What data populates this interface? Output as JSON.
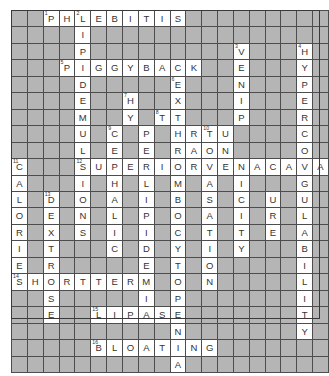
{
  "puzzle": {
    "type": "crossword-grid",
    "rows": 20,
    "cols": 20,
    "cell_fill_color": "#b5b5b5",
    "cell_open_color": "#ffffff",
    "grid_line_color": "#4d4d4d",
    "letter_color": "#333333",
    "grid": [
      [
        "",
        "",
        "P",
        "H",
        "L",
        "E",
        "B",
        "I",
        "T",
        "I",
        "S",
        "",
        "",
        "",
        "",
        "",
        "",
        "",
        "",
        ""
      ],
      [
        "",
        "",
        "",
        "",
        "I",
        "",
        "",
        "",
        "",
        "",
        "",
        "",
        "",
        "",
        "",
        "",
        "",
        "",
        "",
        ""
      ],
      [
        "",
        "",
        "",
        "",
        "P",
        "",
        "",
        "",
        "",
        "",
        "",
        "",
        "",
        "",
        "V",
        "",
        "",
        "",
        "H",
        ""
      ],
      [
        "",
        "",
        "",
        "P",
        "I",
        "G",
        "G",
        "Y",
        "B",
        "A",
        "C",
        "K",
        "",
        "",
        "E",
        "",
        "",
        "",
        "Y",
        ""
      ],
      [
        "",
        "",
        "",
        "",
        "D",
        "",
        "",
        "",
        "",
        "",
        "E",
        "",
        "",
        "",
        "N",
        "",
        "",
        "",
        "P",
        ""
      ],
      [
        "",
        "",
        "",
        "",
        "E",
        "",
        "",
        "H",
        "",
        "",
        "X",
        "",
        "",
        "",
        "I",
        "",
        "",
        "",
        "E",
        ""
      ],
      [
        "",
        "",
        "",
        "",
        "M",
        "",
        "",
        "Y",
        "",
        "T",
        "T",
        "",
        "",
        "",
        "P",
        "",
        "",
        "",
        "R",
        ""
      ],
      [
        "",
        "",
        "",
        "",
        "U",
        "",
        "C",
        "",
        "P",
        "",
        "H",
        "R",
        "T",
        "U",
        "",
        "",
        "",
        "",
        "C",
        ""
      ],
      [
        "",
        "",
        "",
        "",
        "L",
        "",
        "E",
        "",
        "E",
        "",
        "R",
        "A",
        "O",
        "N",
        "",
        "",
        "",
        "",
        "O",
        ""
      ],
      [
        "C",
        "",
        "",
        "",
        "S",
        "U",
        "P",
        "E",
        "R",
        "I",
        "O",
        "R",
        "V",
        "E",
        "N",
        "A",
        "C",
        "A",
        "V",
        "A"
      ],
      [
        "A",
        "",
        "",
        "",
        "I",
        "",
        "H",
        "",
        "L",
        "",
        "M",
        "",
        "A",
        "",
        "I",
        "",
        "",
        "",
        "G",
        ""
      ],
      [
        "L",
        "",
        "D",
        "",
        "O",
        "",
        "A",
        "",
        "I",
        "",
        "B",
        "",
        "S",
        "",
        "C",
        "",
        "U",
        "",
        "U",
        ""
      ],
      [
        "O",
        "",
        "E",
        "",
        "N",
        "",
        "L",
        "",
        "P",
        "",
        "O",
        "",
        "A",
        "",
        "I",
        "",
        "R",
        "",
        "L",
        ""
      ],
      [
        "R",
        "",
        "X",
        "",
        "S",
        "",
        "I",
        "",
        "I",
        "",
        "C",
        "",
        "T",
        "",
        "T",
        "",
        "E",
        "",
        "A",
        ""
      ],
      [
        "I",
        "",
        "T",
        "",
        "",
        "",
        "C",
        "",
        "D",
        "",
        "Y",
        "",
        "I",
        "",
        "Y",
        "",
        "",
        "",
        "B",
        ""
      ],
      [
        "E",
        "",
        "R",
        "",
        "",
        "",
        "",
        "",
        "E",
        "",
        "T",
        "",
        "O",
        "",
        "",
        "",
        "",
        "",
        "I",
        ""
      ],
      [
        "S",
        "H",
        "O",
        "R",
        "T",
        "T",
        "E",
        "R",
        "M",
        "",
        "O",
        "",
        "N",
        "",
        "",
        "",
        "",
        "",
        "L",
        ""
      ],
      [
        "",
        "",
        "S",
        "",
        "",
        "",
        "",
        "",
        "I",
        "",
        "P",
        "",
        "",
        "",
        "",
        "",
        "",
        "",
        "I",
        ""
      ],
      [
        "",
        "",
        "E",
        "",
        "",
        "L",
        "I",
        "P",
        "A",
        "S",
        "E",
        "",
        "",
        "",
        "",
        "",
        "",
        "",
        "T",
        ""
      ],
      [
        "",
        "",
        "",
        "",
        "",
        "",
        "",
        "",
        "",
        "",
        "N",
        "",
        "",
        "",
        "",
        "",
        "",
        "",
        "Y",
        ""
      ]
    ],
    "extra_rows": [
      [
        "",
        "",
        "",
        "",
        "",
        "B",
        "L",
        "O",
        "A",
        "T",
        "I",
        "N",
        "G",
        "",
        "",
        "",
        "",
        "",
        "",
        ""
      ],
      [
        "",
        "",
        "",
        "",
        "",
        "",
        "",
        "",
        "",
        "",
        "A",
        "",
        "",
        "",
        "",
        "",
        "",
        "",
        "",
        ""
      ]
    ],
    "numbers": {
      "0_2": "1",
      "0_4": "2",
      "2_14": "3",
      "2_18": "4",
      "3_3": "5",
      "4_10": "6",
      "5_7": "7",
      "6_9": "8",
      "7_6": "9",
      "7_12": "10",
      "9_0": "11",
      "9_4": "12",
      "11_2": "13",
      "16_0": "14",
      "18_5": "15",
      "20_5": "16"
    },
    "answers_across": [
      {
        "number": "1",
        "text": "PHLEBITIS"
      },
      {
        "number": "5",
        "text": "PIGGYBACK"
      },
      {
        "number": "12",
        "text": "SUPERIORVENACAVA"
      },
      {
        "number": "14",
        "text": "SHORTTERM"
      },
      {
        "number": "15",
        "text": "LIPASE"
      },
      {
        "number": "16",
        "text": "BLOATING"
      }
    ],
    "answers_down": [
      {
        "number": "2",
        "text": "LIPIDEMULSION"
      },
      {
        "number": "3",
        "text": "VENIPUNCTURE"
      },
      {
        "number": "4",
        "text": "HYPERCOAGULABILITY"
      },
      {
        "number": "6",
        "text": "EXTRAVASATION"
      },
      {
        "number": "7",
        "text": "HYPERLIPIDEMIA"
      },
      {
        "number": "8",
        "text": "THROMBOCYTOPENIA"
      },
      {
        "number": "9",
        "text": "CEPHALIC"
      },
      {
        "number": "10",
        "text": "TUNNELED"
      },
      {
        "number": "11",
        "text": "CALORIES"
      },
      {
        "number": "13",
        "text": "DEXTROSE"
      }
    ]
  }
}
